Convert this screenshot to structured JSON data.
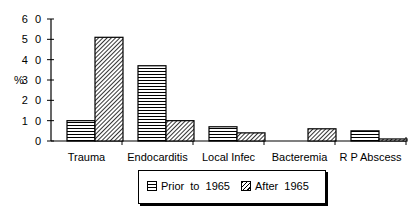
{
  "chart_data": {
    "type": "bar",
    "title": "",
    "xlabel": "",
    "ylabel": "%",
    "ylim": [
      0,
      60
    ],
    "yticks": [
      0,
      10,
      20,
      30,
      40,
      50,
      60
    ],
    "ytick_labels": [
      "0",
      "1 0",
      "2 0",
      "3 0",
      "4 0",
      "5 0",
      "6 0"
    ],
    "categories": [
      "Trauma",
      "Endocarditis",
      "Local Infec",
      "Bacteremia",
      "R P Abscess"
    ],
    "series": [
      {
        "name": "Prior to 1965",
        "pattern": "horizontal-lines",
        "values": [
          10,
          37,
          7,
          0,
          5
        ]
      },
      {
        "name": "After 1965",
        "pattern": "diagonal-hatch",
        "values": [
          51,
          10,
          4,
          6,
          1
        ]
      }
    ],
    "grid": false,
    "legend_position": "bottom-center"
  },
  "legend": {
    "prior_label": "Prior to 1965",
    "after_label": "After 1965"
  },
  "axis": {
    "ylabel": "%"
  }
}
